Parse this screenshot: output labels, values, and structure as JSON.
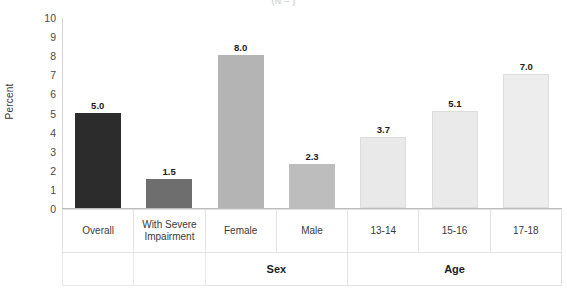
{
  "chart_data": {
    "type": "bar",
    "title": "(N = )",
    "xlabel": "",
    "ylabel": "Percent",
    "ylim": [
      0,
      10
    ],
    "ytick_labels": [
      "10",
      "9",
      "8",
      "7",
      "6",
      "5",
      "4",
      "3",
      "2",
      "1",
      "0"
    ],
    "ytick_values": [
      10,
      9,
      8,
      7,
      6,
      5,
      4,
      3,
      2,
      1,
      0
    ],
    "grid": false,
    "legend": "none",
    "categories": [
      "Overall",
      "With Severe Impairment",
      "Female",
      "Male",
      "13-14",
      "15-16",
      "17-18"
    ],
    "values": [
      5.0,
      1.5,
      8.0,
      2.3,
      3.7,
      5.1,
      7.0
    ],
    "value_labels": [
      "5.0",
      "1.5",
      "8.0",
      "2.3",
      "3.7",
      "5.1",
      "7.0"
    ],
    "bar_colors": [
      "#2c2c2c",
      "#6e6e6e",
      "#b4b4b4",
      "#bdbdbd",
      "#e9e9e9",
      "#eaeaea",
      "#ededed"
    ],
    "bar_borders": [
      "#2c2c2c",
      "#6e6e6e",
      "#b4b4b4",
      "#bdbdbd",
      "#dddddd",
      "#dddddd",
      "#dddddd"
    ],
    "group_row": [
      {
        "label": "",
        "span": 1
      },
      {
        "label": "",
        "span": 1
      },
      {
        "label": "Sex",
        "span": 2
      },
      {
        "label": "Age",
        "span": 3
      }
    ]
  },
  "axis": {
    "y_label": "Percent"
  }
}
